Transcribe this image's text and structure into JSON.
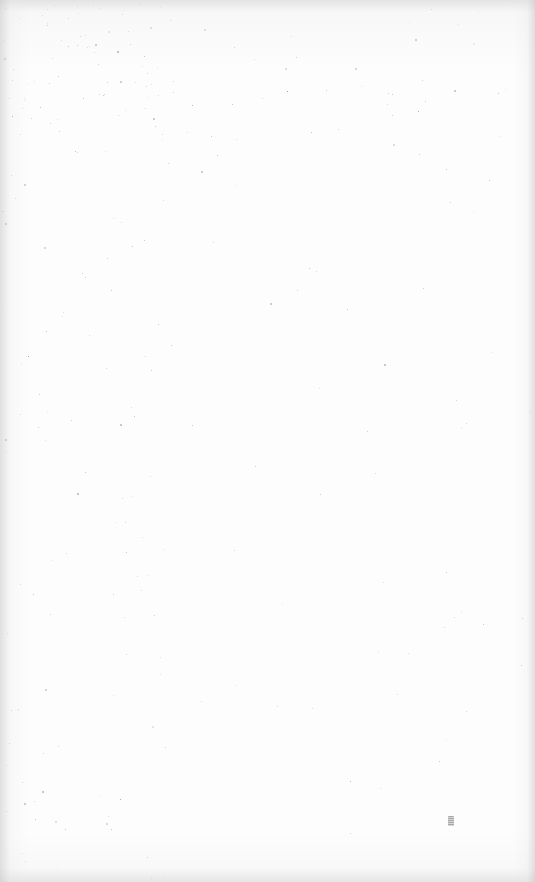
{
  "document": {
    "type": "blank-scanned-page",
    "text_content": "",
    "mark": {
      "description": "small illegible smudge",
      "x": 448,
      "y": 816
    }
  },
  "colors": {
    "paper": "#fdfdfd",
    "edge_shadow": "#c8c8c8",
    "speck": "#9a9a9a"
  }
}
